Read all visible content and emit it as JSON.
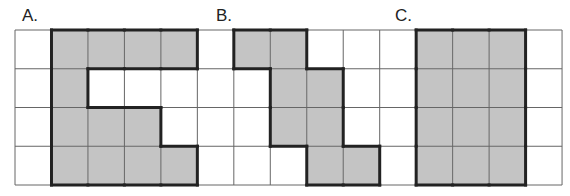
{
  "figure": {
    "grid": {
      "cols": 15,
      "rows": 4,
      "left": 15,
      "top": 30,
      "cell_w": 36.47,
      "cell_h": 38.75,
      "line_color": "#666666",
      "shade_color": "#c4c4c4",
      "outline_color": "#222222"
    },
    "shapes": [
      {
        "label": "A.",
        "label_x": 22,
        "label_y": 8,
        "cells": [
          [
            0,
            1
          ],
          [
            0,
            2
          ],
          [
            0,
            3
          ],
          [
            0,
            4
          ],
          [
            1,
            1
          ],
          [
            2,
            1
          ],
          [
            2,
            2
          ],
          [
            2,
            3
          ],
          [
            3,
            1
          ],
          [
            3,
            2
          ],
          [
            3,
            3
          ],
          [
            3,
            4
          ]
        ]
      },
      {
        "label": "B.",
        "label_x": 216,
        "label_y": 8,
        "cells": [
          [
            0,
            6
          ],
          [
            0,
            7
          ],
          [
            1,
            7
          ],
          [
            1,
            8
          ],
          [
            2,
            7
          ],
          [
            2,
            8
          ],
          [
            3,
            8
          ],
          [
            3,
            9
          ]
        ]
      },
      {
        "label": "C.",
        "label_x": 395,
        "label_y": 8,
        "cells": [
          [
            0,
            11
          ],
          [
            0,
            12
          ],
          [
            0,
            13
          ],
          [
            1,
            11
          ],
          [
            1,
            12
          ],
          [
            1,
            13
          ],
          [
            2,
            11
          ],
          [
            2,
            12
          ],
          [
            2,
            13
          ],
          [
            3,
            11
          ],
          [
            3,
            12
          ],
          [
            3,
            13
          ]
        ]
      }
    ]
  }
}
